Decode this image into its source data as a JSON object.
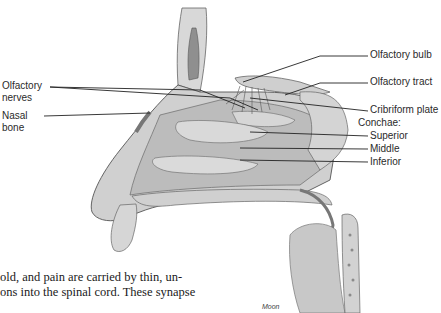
{
  "figure": {
    "labels": {
      "olfactory_nerves": [
        "Olfactory",
        "nerves"
      ],
      "nasal_bone": [
        "Nasal",
        "bone"
      ],
      "olfactory_bulb": "Olfactory bulb",
      "olfactory_tract": "Olfactory tract",
      "cribriform_plate": "Cribriform plate",
      "conchae_heading": "Conchae:",
      "superior": "Superior",
      "middle": "Middle",
      "inferior": "Inferior"
    },
    "credit": "Moon",
    "colors": {
      "tissue_light": "#e6e6e6",
      "tissue_mid": "#c4c4c4",
      "tissue_dark": "#8a8a8a",
      "outline": "#555555",
      "leader_line": "#222222"
    }
  },
  "body_text": {
    "lines": [
      "old, and pain are carried by thin, un-",
      "ons into the spinal cord. These synapse"
    ]
  }
}
